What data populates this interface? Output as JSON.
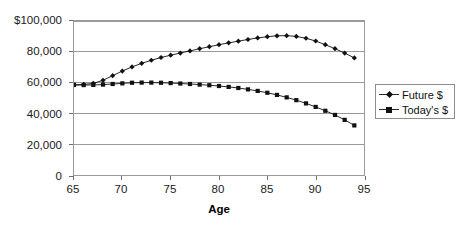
{
  "chart_data": {
    "type": "line",
    "title": "",
    "xlabel": "Age",
    "ylabel": "",
    "xlim": [
      65,
      95
    ],
    "ylim": [
      0,
      100000
    ],
    "grid": true,
    "legend_position": "right",
    "x_ticks": [
      "65",
      "70",
      "75",
      "80",
      "85",
      "90",
      "95"
    ],
    "x_tick_values": [
      65,
      70,
      75,
      80,
      85,
      90,
      95
    ],
    "y_ticks": [
      "0",
      "20,000",
      "40,000",
      "60,000",
      "80,000",
      "$100,000"
    ],
    "y_tick_values": [
      0,
      20000,
      40000,
      60000,
      80000,
      100000
    ],
    "x": [
      65,
      66,
      67,
      68,
      69,
      70,
      71,
      72,
      73,
      74,
      75,
      76,
      77,
      78,
      79,
      80,
      81,
      82,
      83,
      84,
      85,
      86,
      87,
      88,
      89,
      90,
      91,
      92,
      93,
      94
    ],
    "series": [
      {
        "name": "Future $",
        "marker": "diamond",
        "color": "#111111",
        "values": [
          58500,
          58800,
          59500,
          61500,
          64500,
          67500,
          70200,
          72500,
          74500,
          76300,
          77800,
          79200,
          80600,
          82000,
          83300,
          84600,
          85800,
          86900,
          88000,
          89000,
          89800,
          90400,
          90500,
          90000,
          88800,
          87000,
          84600,
          82000,
          79200,
          76000
        ]
      },
      {
        "name": "Today's $",
        "marker": "square",
        "color": "#111111",
        "values": [
          58500,
          58400,
          58500,
          58700,
          59100,
          59500,
          59900,
          60000,
          60000,
          59900,
          59700,
          59400,
          59100,
          58700,
          58300,
          57800,
          57200,
          56500,
          55600,
          54600,
          53400,
          52000,
          50400,
          48600,
          46500,
          44200,
          41700,
          39000,
          35800,
          32200
        ]
      }
    ]
  },
  "legend": {
    "items": [
      {
        "label": "Future $"
      },
      {
        "label": "Today's $"
      }
    ]
  }
}
